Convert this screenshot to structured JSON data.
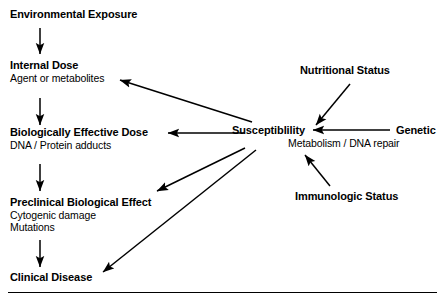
{
  "diagram": {
    "type": "flowchart",
    "line_color": "#000000",
    "background_color": "#ffffff",
    "nodes": {
      "environmental_exposure": {
        "title": "Environmental Exposure",
        "sub": ""
      },
      "internal_dose": {
        "title": "Internal Dose",
        "sub": "Agent or metabolites"
      },
      "biologically_effective_dose": {
        "title": "Biologically Effective Dose",
        "sub": "DNA / Protein adducts"
      },
      "preclinical_biological_effect": {
        "title": "Preclinical Biological Effect",
        "sub": "Cytogenic damage",
        "sub2": "Mutations"
      },
      "clinical_disease": {
        "title": "Clinical Disease",
        "sub": ""
      },
      "susceptibility": {
        "title": "Susceptiblility",
        "sub": "Metabolism / DNA repair"
      },
      "nutritional_status": {
        "title": "Nutritional Status",
        "sub": ""
      },
      "genetic": {
        "title": "Genetic",
        "sub": ""
      },
      "immunologic_status": {
        "title": "Immunologic Status",
        "sub": ""
      }
    },
    "edges": [
      {
        "name": "exposure-to-internal-dose",
        "from": "environmental_exposure",
        "to": "internal_dose"
      },
      {
        "name": "internal-dose-to-effective-dose",
        "from": "internal_dose",
        "to": "biologically_effective_dose"
      },
      {
        "name": "effective-dose-to-preclinical-effect",
        "from": "biologically_effective_dose",
        "to": "preclinical_biological_effect"
      },
      {
        "name": "preclinical-effect-to-clinical-disease",
        "from": "preclinical_biological_effect",
        "to": "clinical_disease"
      },
      {
        "name": "susceptibility-to-internal-dose",
        "from": "susceptibility",
        "to": "internal_dose"
      },
      {
        "name": "susceptibility-to-effective-dose",
        "from": "susceptibility",
        "to": "biologically_effective_dose"
      },
      {
        "name": "susceptibility-to-preclinical-effect",
        "from": "susceptibility",
        "to": "preclinical_biological_effect"
      },
      {
        "name": "susceptibility-to-clinical-disease",
        "from": "susceptibility",
        "to": "clinical_disease"
      },
      {
        "name": "nutritional-status-to-susceptibility",
        "from": "nutritional_status",
        "to": "susceptibility"
      },
      {
        "name": "genetic-to-susceptibility",
        "from": "genetic",
        "to": "susceptibility"
      },
      {
        "name": "immunologic-status-to-susceptibility",
        "from": "immunologic_status",
        "to": "susceptibility"
      }
    ]
  }
}
